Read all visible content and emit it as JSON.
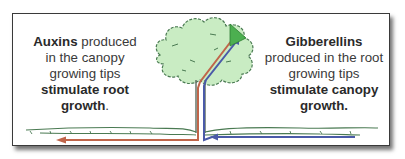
{
  "left_caption": {
    "line1_bold": "Auxins",
    "line1_rest": " produced",
    "line2": "in the canopy",
    "line3": "growing tips",
    "line4_bold": "stimulate root",
    "line5_bold": "growth",
    "line5_rest": "."
  },
  "right_caption": {
    "line1_bold": "Gibberellins",
    "line2": "produced in the root",
    "line3": "growing tips",
    "line4_bold": "stimulate canopy",
    "line5_bold": "growth."
  },
  "colors": {
    "canopy_fill": "#c9ecc3",
    "outline_green": "#4a7a52",
    "auxin_arrow": "#c0654a",
    "gibberellin_arrow": "#4a5aa8",
    "triangle": "#4caf50",
    "border": "#3a3a3a"
  },
  "icons": {
    "tree": "tree-icon",
    "auxin_arrow": "red-arrow-left-icon",
    "gibberellin_arrow": "blue-arrow-up-icon",
    "growing_tip": "green-triangle-icon"
  }
}
